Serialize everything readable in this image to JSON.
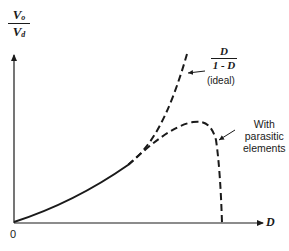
{
  "diagram": {
    "type": "plot-sketch",
    "y_axis_label": {
      "numerator": "V",
      "numerator_sub": "o",
      "denominator": "V",
      "denominator_sub": "d"
    },
    "x_axis_label": "D",
    "origin_label": "0",
    "curves": [
      {
        "name": "ideal",
        "label_numerator": "D",
        "label_denominator": "1 - D",
        "label_note": "(ideal)",
        "style": "dashed"
      },
      {
        "name": "parasitic",
        "label": "With parasitic elements",
        "label_lines": [
          "With",
          "parasitic",
          "elements"
        ],
        "style": "dashed"
      }
    ],
    "colors": {
      "ink": "#1a1a1a",
      "background": "#ffffff"
    }
  }
}
